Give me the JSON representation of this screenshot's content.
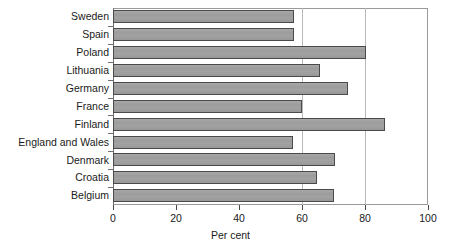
{
  "chart_data": {
    "type": "bar",
    "orientation": "horizontal",
    "title": "",
    "xlabel": "Per cent",
    "ylabel": "",
    "xlim": [
      0,
      100
    ],
    "xticks": [
      0,
      20,
      40,
      60,
      80,
      100
    ],
    "xtick_labels": [
      "0",
      "20",
      "40",
      "60",
      "80",
      "100"
    ],
    "gridlines_x": [
      60,
      80
    ],
    "grid": true,
    "legend": false,
    "bar_color": "#9e9e9e",
    "bar_edge_color": "#4a4a4a",
    "categories": [
      "Sweden",
      "Spain",
      "Poland",
      "Lithuania",
      "Germany",
      "France",
      "Finland",
      "England and Wales",
      "Denmark",
      "Croatia",
      "Belgium"
    ],
    "values": [
      57.5,
      57.5,
      80.3,
      65.7,
      74.6,
      60.0,
      86.3,
      57.3,
      70.5,
      64.8,
      70.2
    ]
  }
}
